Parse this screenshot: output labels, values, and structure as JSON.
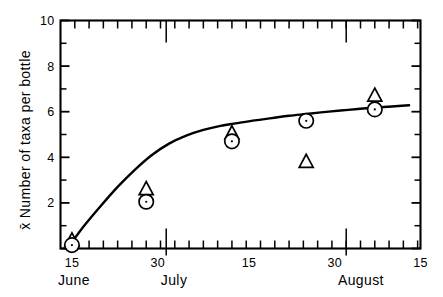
{
  "figure": {
    "background_color": "#ffffff",
    "ink_color": "#000000",
    "axis_label_y": "Number of taxa per bottle",
    "axis_label_y_prefix": "x̄",
    "axis_label_x": ""
  },
  "chart_data": {
    "type": "scatter",
    "title": "",
    "subtitle": "",
    "xlabel": "",
    "ylabel": "x̄ Number of taxa per bottle",
    "grid": false,
    "legend": "none",
    "ylim": [
      0,
      10
    ],
    "y_major_ticks": [
      0,
      2,
      4,
      6,
      8,
      10
    ],
    "y_major_tick_labels": [
      "",
      "2",
      "4",
      "6",
      "8",
      "10"
    ],
    "y_minor_ticks": [
      1,
      3,
      5,
      7,
      9
    ],
    "xlim_days": [
      0,
      63
    ],
    "x_tick_days": [
      0,
      5,
      10,
      15,
      20,
      25,
      30,
      35,
      40,
      45,
      50,
      55,
      60,
      63
    ],
    "x_labeled_ticks": [
      {
        "day": 2,
        "label": "15"
      },
      {
        "day": 17,
        "label": "30"
      },
      {
        "day": 33,
        "label": "15"
      },
      {
        "day": 48,
        "label": "30"
      },
      {
        "day": 63,
        "label": "15"
      }
    ],
    "x_month_boundaries": [
      {
        "day": 18,
        "label": "June"
      },
      {
        "day": 19,
        "label": "July"
      },
      {
        "day": 50,
        "label": "August"
      }
    ],
    "x_month_labels": [
      {
        "day": 2,
        "label": "June"
      },
      {
        "day": 20,
        "label": "July"
      },
      {
        "day": 51,
        "label": "August"
      }
    ],
    "series": [
      {
        "name": "circle-series",
        "marker": "circle",
        "x_days": [
          2,
          15,
          30,
          43,
          55
        ],
        "values": [
          0.15,
          2.05,
          4.7,
          5.6,
          6.1
        ]
      },
      {
        "name": "triangle-series",
        "marker": "triangle",
        "x_days": [
          2,
          15,
          30,
          43,
          55
        ],
        "values": [
          0.35,
          2.6,
          5.05,
          3.8,
          6.7
        ]
      }
    ],
    "fitted_curve": {
      "name": "fitted-asymptotic-curve",
      "points": [
        [
          1.5,
          0.1
        ],
        [
          4,
          0.95
        ],
        [
          7,
          1.85
        ],
        [
          10,
          2.7
        ],
        [
          13,
          3.45
        ],
        [
          16,
          4.1
        ],
        [
          19,
          4.6
        ],
        [
          22,
          4.95
        ],
        [
          25,
          5.2
        ],
        [
          28,
          5.38
        ],
        [
          31,
          5.5
        ],
        [
          34,
          5.62
        ],
        [
          37,
          5.72
        ],
        [
          40,
          5.82
        ],
        [
          43,
          5.9
        ],
        [
          46,
          5.98
        ],
        [
          49,
          6.05
        ],
        [
          52,
          6.12
        ],
        [
          55,
          6.18
        ],
        [
          58,
          6.23
        ],
        [
          61,
          6.28
        ]
      ]
    }
  }
}
